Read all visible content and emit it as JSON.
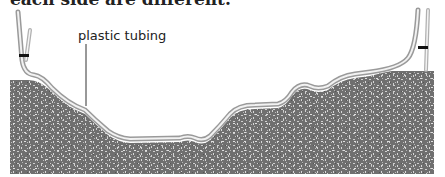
{
  "caption": {
    "text": "each side are different."
  },
  "diagram": {
    "label": "plastic tubing",
    "colors": {
      "soil": "#6f6f6f",
      "soil_speckle": "#c9c9c9",
      "tubing_outer": "#9a9a9a",
      "tubing_inner": "#f2f2f2",
      "clamp": "#111111",
      "leader_line": "#333333"
    }
  }
}
